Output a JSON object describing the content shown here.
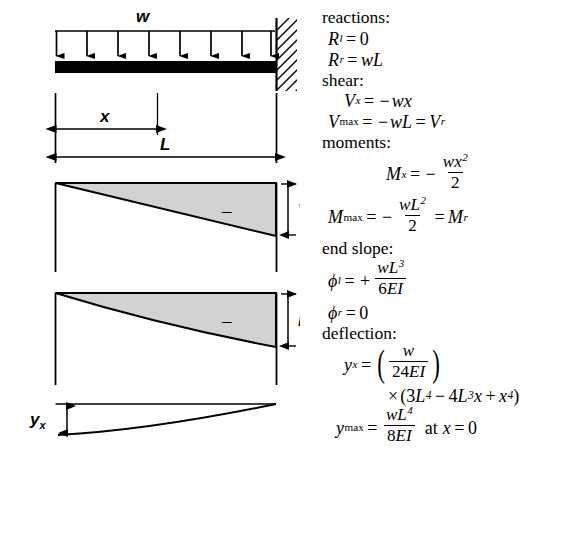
{
  "figure": {
    "load_label": "w",
    "dimension_x_label": "x",
    "dimension_L_label": "L",
    "shear_ordinate_label": "V",
    "shear_ordinate_sub": "r",
    "moment_ordinate_label": "M",
    "moment_ordinate_sub": "r",
    "deflection_label": "y",
    "deflection_sub": "x",
    "shear_sign": "–",
    "moment_sign": "–",
    "arrow_count": 8,
    "fill_color": "#d2d2d2",
    "stroke_color": "#000000",
    "beam_color": "#000000"
  },
  "equations": {
    "reactions_heading": "reactions:",
    "shear_heading": "shear:",
    "moments_heading": "moments:",
    "end_slope_heading": "end slope:",
    "deflection_heading": "deflection:",
    "R_l": {
      "var": "R",
      "sub": "l",
      "eq": "=",
      "rhs": "0"
    },
    "R_r": {
      "var": "R",
      "sub": "r",
      "eq": "=",
      "rhs_w": "w",
      "rhs_L": "L"
    },
    "V_x": {
      "var": "V",
      "sub": "x",
      "eq": "=",
      "minus": "−",
      "rhs_w": "w",
      "rhs_x": "x"
    },
    "V_max": {
      "var": "V",
      "sub": "max",
      "eq": "=",
      "minus": "−",
      "rhs_w": "w",
      "rhs_L": "L",
      "eq2": "=",
      "tail_var": "V",
      "tail_sub": "r"
    },
    "M_x": {
      "var": "M",
      "sub": "x",
      "eq": "=",
      "minus": "−",
      "num_w": "w",
      "num_x": "x",
      "num_exp": "2",
      "den": "2"
    },
    "M_max": {
      "var": "M",
      "sub": "max",
      "eq": "=",
      "minus": "−",
      "num_w": "w",
      "num_L": "L",
      "num_exp": "2",
      "den": "2",
      "eq2": "=",
      "tail_var": "M",
      "tail_sub": "r"
    },
    "phi_l": {
      "var": "ϕ",
      "sub": "l",
      "eq": "=",
      "plus": "+",
      "num_w": "w",
      "num_L": "L",
      "num_exp": "3",
      "den_6": "6",
      "den_E": "E",
      "den_I": "I"
    },
    "phi_r": {
      "var": "ϕ",
      "sub": "r",
      "eq": "=",
      "rhs": "0"
    },
    "y_x": {
      "var": "y",
      "sub": "x",
      "eq": "=",
      "paren_l": "(",
      "num_w": "w",
      "den_24": "24",
      "den_E": "E",
      "den_I": "I",
      "paren_r": ")"
    },
    "y_x_cont": {
      "times": "×",
      "paren_l": "(",
      "c3": "3",
      "L1": "L",
      "e4a": "4",
      "minus": "−",
      "c4": "4",
      "L2": "L",
      "e3": "3",
      "x1": "x",
      "plus": "+",
      "x2": "x",
      "e4b": "4",
      "paren_r": ")"
    },
    "y_max": {
      "var": "y",
      "sub": "max",
      "eq": "=",
      "num_w": "w",
      "num_L": "L",
      "num_exp": "4",
      "den_8": "8",
      "den_E": "E",
      "den_I": "I",
      "at_text": "at",
      "at_var": "x",
      "at_eq": "=",
      "at_val": "0"
    }
  }
}
